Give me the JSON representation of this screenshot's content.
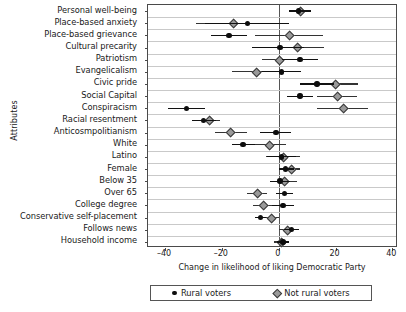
{
  "chart_data": {
    "type": "scatter",
    "title": "",
    "xlabel": "Change in likelihood of liking Democratic Party",
    "ylabel": "Attributes",
    "xlim": [
      -46,
      42
    ],
    "xticks": [
      -40,
      -20,
      0,
      20,
      40
    ],
    "xticklabels": [
      "–40",
      "–20",
      "0",
      "20",
      "40"
    ],
    "grid": true,
    "legend_position": "bottom",
    "reference_line": 0,
    "categories": [
      "Personal well-being",
      "Place-based anxiety",
      "Place-based grievance",
      "Cultural precarity",
      "Patriotism",
      "Evangelicalism",
      "Civic pride",
      "Social Capital",
      "Conspiracism",
      "Racial resentment",
      "Anticosmpolitianism",
      "White",
      "Latino",
      "Female",
      "Below 35",
      "Over 65",
      "College degree",
      "Conservative self-placement",
      "Follows news",
      "Household income"
    ],
    "series": [
      {
        "name": "Rural voters",
        "marker": "circle",
        "color": "#0d0d0d",
        "values": [
          7.0,
          -11.0,
          -17.5,
          0.5,
          7.5,
          1.0,
          13.5,
          7.5,
          -32.5,
          -26.5,
          -1.0,
          -12.5,
          1.0,
          2.5,
          0.5,
          2.0,
          1.5,
          -6.5,
          4.5,
          1.5
        ],
        "ci_low": [
          3.5,
          -26.0,
          -24.0,
          -9.5,
          1.0,
          -6.0,
          7.5,
          3.0,
          -39.0,
          -30.5,
          -6.5,
          -16.5,
          -4.0,
          0.0,
          -3.0,
          -1.0,
          -2.5,
          -8.5,
          2.0,
          -0.5
        ],
        "ci_high": [
          11.5,
          3.5,
          -11.0,
          9.0,
          14.0,
          8.0,
          19.5,
          12.0,
          -26.0,
          -22.0,
          4.5,
          -8.5,
          6.0,
          5.5,
          4.0,
          5.0,
          5.5,
          -4.5,
          7.0,
          3.5
        ]
      },
      {
        "name": "Not rural voters",
        "marker": "diamond",
        "color": "#9a9a9a",
        "values": [
          7.5,
          -16.0,
          3.5,
          6.5,
          0.0,
          -8.0,
          20.0,
          20.5,
          22.5,
          -24.5,
          -17.0,
          -3.5,
          1.5,
          4.5,
          2.0,
          -7.5,
          -5.5,
          -2.5,
          3.0,
          1.0
        ],
        "ci_low": [
          4.0,
          -29.0,
          -8.5,
          -2.5,
          -6.0,
          -16.5,
          12.0,
          13.5,
          13.5,
          -28.5,
          -22.5,
          -9.5,
          -4.5,
          1.5,
          -2.0,
          -11.0,
          -9.0,
          -5.0,
          0.0,
          -1.5
        ],
        "ci_high": [
          11.5,
          -3.0,
          15.5,
          16.0,
          7.0,
          0.5,
          28.0,
          27.5,
          31.5,
          -20.5,
          -11.0,
          2.5,
          7.5,
          7.5,
          6.5,
          -4.0,
          -2.0,
          0.0,
          6.0,
          3.5
        ]
      }
    ]
  },
  "legend": {
    "items": [
      {
        "label": "Rural voters",
        "marker": "circle-marker"
      },
      {
        "label": "Not rural voters",
        "marker": "diamond-marker"
      }
    ]
  }
}
